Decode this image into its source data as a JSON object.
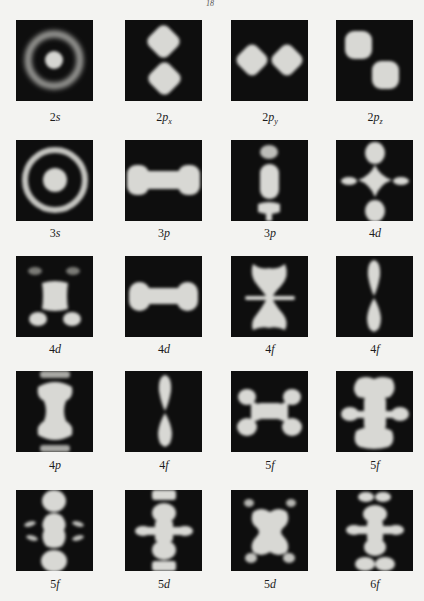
{
  "page": {
    "top_mark": "18"
  },
  "figure": {
    "layout": {
      "columns": 4,
      "rows": 5
    },
    "colors": {
      "background": "#f3f3f1",
      "panel": "#0e0e0e",
      "orbital_glow": "#d9d9d6"
    },
    "panels": [
      {
        "n": "2",
        "l": "s",
        "sub": "",
        "label": "2s"
      },
      {
        "n": "2",
        "l": "p",
        "sub": "x",
        "label": "2px"
      },
      {
        "n": "2",
        "l": "p",
        "sub": "y",
        "label": "2py"
      },
      {
        "n": "2",
        "l": "p",
        "sub": "z",
        "label": "2pz"
      },
      {
        "n": "3",
        "l": "s",
        "sub": "",
        "label": "3s"
      },
      {
        "n": "3",
        "l": "p",
        "sub": "",
        "label": "3p"
      },
      {
        "n": "3",
        "l": "p",
        "sub": "",
        "label": "3p"
      },
      {
        "n": "4",
        "l": "d",
        "sub": "",
        "label": "4d"
      },
      {
        "n": "4",
        "l": "d",
        "sub": "",
        "label": "4d"
      },
      {
        "n": "4",
        "l": "d",
        "sub": "",
        "label": "4d"
      },
      {
        "n": "4",
        "l": "f",
        "sub": "",
        "label": "4f"
      },
      {
        "n": "4",
        "l": "f",
        "sub": "",
        "label": "4f"
      },
      {
        "n": "4",
        "l": "p",
        "sub": "",
        "label": "4p"
      },
      {
        "n": "4",
        "l": "f",
        "sub": "",
        "label": "4f"
      },
      {
        "n": "5",
        "l": "f",
        "sub": "",
        "label": "5f"
      },
      {
        "n": "5",
        "l": "f",
        "sub": "",
        "label": "5f"
      },
      {
        "n": "5",
        "l": "f",
        "sub": "",
        "label": "5f"
      },
      {
        "n": "5",
        "l": "d",
        "sub": "",
        "label": "5d"
      },
      {
        "n": "5",
        "l": "d",
        "sub": "",
        "label": "5d"
      },
      {
        "n": "6",
        "l": "f",
        "sub": "",
        "label": "6f"
      }
    ]
  }
}
